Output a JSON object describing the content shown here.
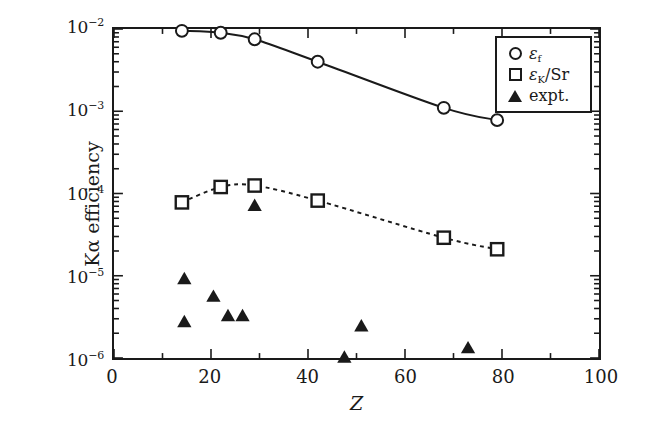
{
  "chart_data": {
    "type": "scatter",
    "title": "",
    "xlabel": "Z",
    "ylabel": "Kα efficiency",
    "xlim": [
      0,
      100
    ],
    "ylim": [
      1e-06,
      0.01
    ],
    "yscale": "log",
    "xscale": "linear",
    "grid": false,
    "legend_position": "top-right",
    "xticks": [
      0,
      20,
      40,
      60,
      80,
      100
    ],
    "xtick_labels": [
      "0",
      "20",
      "40",
      "60",
      "80",
      "100"
    ],
    "yticks": [
      0.01,
      0.001,
      0.0001,
      1e-05,
      1e-06
    ],
    "ytick_labels": [
      "10−2",
      "10−3",
      "10−4",
      "10−5",
      "10−6"
    ],
    "ytick_mantissa": [
      "10",
      "10",
      "10",
      "10",
      "10"
    ],
    "ytick_exponent": [
      "−2",
      "−3",
      "−4",
      "−5",
      "−6"
    ],
    "series": [
      {
        "name": "ε_f",
        "legend_label": "εf",
        "marker": "open-circle",
        "line": "solid",
        "x": [
          14,
          22,
          29,
          42,
          68,
          79
        ],
        "y": [
          0.0095,
          0.009,
          0.0075,
          0.004,
          0.0011,
          0.00078
        ]
      },
      {
        "name": "ε_K/Sr",
        "legend_label": "εK/Sr",
        "marker": "open-square",
        "line": "dashed",
        "x": [
          14,
          22,
          29,
          42,
          68,
          79
        ],
        "y": [
          7.8e-05,
          0.00012,
          0.000125,
          8.2e-05,
          2.9e-05,
          2.1e-05
        ]
      },
      {
        "name": "expt.",
        "legend_label": "expt.",
        "marker": "filled-triangle",
        "line": "none",
        "x": [
          14.5,
          14.5,
          20.5,
          23.5,
          26.5,
          29,
          47.5,
          51,
          73
        ],
        "y": [
          9e-06,
          2.7e-06,
          5.5e-06,
          3.2e-06,
          3.2e-06,
          7e-05,
          1e-06,
          2.4e-06,
          1.3e-06
        ]
      }
    ]
  },
  "axes": {
    "xlabel": "Z",
    "ylabel": "Kα efficiency"
  },
  "legend": {
    "items": [
      {
        "label_eps": "ε",
        "label_sub": "f",
        "label_tail": "",
        "marker": "open-circle"
      },
      {
        "label_eps": "ε",
        "label_sub": "K",
        "label_tail": "/Sr",
        "marker": "open-square"
      },
      {
        "label_plain": "expt.",
        "marker": "filled-triangle"
      }
    ]
  },
  "style": {
    "ink": "#1a1a1a",
    "background": "#ffffff"
  }
}
